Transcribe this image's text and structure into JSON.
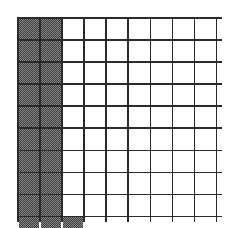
{
  "figure": {
    "kind": "hundredths-grid",
    "grid": {
      "rows": 10,
      "columns": 10,
      "total_cells": 100,
      "shaded_cells": 21,
      "unshaded_cells": 79,
      "fraction_shaded": "21/100",
      "decimal_shaded": "0.21",
      "percent_shaded": "21%"
    },
    "colors": {
      "background": "#ffffff",
      "gridline": "#2a2a2a",
      "cell_fill": "#ffffff",
      "shaded_fill": "#8a8a8a",
      "shaded_dither": "#3b3b3b"
    }
  },
  "chart_data": {
    "type": "heatmap",
    "title": "",
    "subtitle": "",
    "xlabel": "",
    "ylabel": "",
    "grid": true,
    "legend": "none",
    "rows": 10,
    "columns": 10,
    "categories": [
      "1",
      "2",
      "3",
      "4",
      "5",
      "6",
      "7",
      "8",
      "9",
      "10"
    ],
    "row_labels": [
      "1",
      "2",
      "3",
      "4",
      "5",
      "6",
      "7",
      "8",
      "9",
      "10"
    ],
    "value_legend": {
      "0": "unshaded",
      "1": "shaded"
    },
    "values": [
      [
        1,
        1,
        0,
        0,
        0,
        0,
        0,
        0,
        0,
        0
      ],
      [
        1,
        1,
        0,
        0,
        0,
        0,
        0,
        0,
        0,
        0
      ],
      [
        1,
        1,
        0,
        0,
        0,
        0,
        0,
        0,
        0,
        0
      ],
      [
        1,
        1,
        0,
        0,
        0,
        0,
        0,
        0,
        0,
        0
      ],
      [
        1,
        1,
        0,
        0,
        0,
        0,
        0,
        0,
        0,
        0
      ],
      [
        1,
        1,
        0,
        0,
        0,
        0,
        0,
        0,
        0,
        0
      ],
      [
        1,
        1,
        0,
        0,
        0,
        0,
        0,
        0,
        0,
        0
      ],
      [
        1,
        1,
        0,
        0,
        0,
        0,
        0,
        0,
        0,
        0
      ],
      [
        1,
        1,
        0,
        0,
        0,
        0,
        0,
        0,
        0,
        0
      ],
      [
        1,
        1,
        1,
        0,
        0,
        0,
        0,
        0,
        0,
        0
      ]
    ],
    "shaded_count": 21,
    "total_count": 100,
    "fraction": "21/100",
    "decimal": 0.21,
    "percent": 21
  }
}
